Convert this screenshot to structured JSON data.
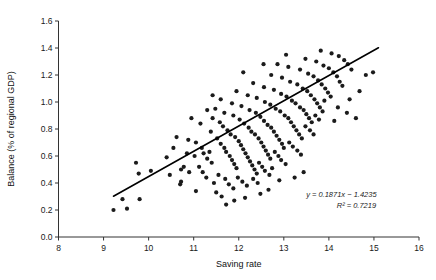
{
  "chart_data": {
    "type": "scatter",
    "title": "",
    "xlabel": "Saving rate",
    "ylabel": "Balance (% of regional GDP)",
    "xlim": [
      8,
      16
    ],
    "ylim": [
      0.0,
      1.6
    ],
    "xticks": [
      8,
      9,
      10,
      11,
      12,
      13,
      14,
      15,
      16
    ],
    "xtick_labels": [
      "8",
      "9",
      "10",
      "11",
      "12",
      "13",
      "14",
      "15",
      "16"
    ],
    "yticks": [
      0.0,
      0.2,
      0.4,
      0.6,
      0.8,
      1.0,
      1.2,
      1.4,
      1.6
    ],
    "ytick_labels": [
      "0.0",
      "0.2",
      "0.4",
      "0.6",
      "0.8",
      "1.0",
      "1.2",
      "1.4",
      "1.6"
    ],
    "grid": false,
    "legend": null,
    "marker_color": "#1b1b1b",
    "marker_size": 2.1,
    "trendline": {
      "slope": 0.1871,
      "intercept": -1.4235,
      "r_squared": 0.7219,
      "x_start": 9.22,
      "x_end": 15.1,
      "y_start": 0.302,
      "y_end": 1.402,
      "color": "#000000"
    },
    "annotations": [
      {
        "text": "y = 0.1871x − 1.4235",
        "x": 13.95,
        "y": 0.3
      },
      {
        "text": "R² = 0.7219",
        "x": 14.05,
        "y": 0.215
      }
    ],
    "equation_label": "y = 0.1871x − 1.4235",
    "r2_label": "R² = 0.7219",
    "points": [
      [
        9.22,
        0.2
      ],
      [
        9.52,
        0.21
      ],
      [
        9.42,
        0.28
      ],
      [
        9.8,
        0.28
      ],
      [
        9.72,
        0.55
      ],
      [
        9.78,
        0.47
      ],
      [
        10.05,
        0.49
      ],
      [
        10.4,
        0.59
      ],
      [
        10.47,
        0.46
      ],
      [
        10.72,
        0.5
      ],
      [
        10.78,
        0.52
      ],
      [
        10.7,
        0.39
      ],
      [
        10.72,
        0.41
      ],
      [
        10.9,
        0.48
      ],
      [
        11.02,
        0.6
      ],
      [
        10.62,
        0.74
      ],
      [
        10.88,
        0.72
      ],
      [
        11.05,
        0.7
      ],
      [
        11.18,
        0.66
      ],
      [
        11.22,
        0.62
      ],
      [
        11.3,
        0.58
      ],
      [
        11.35,
        0.63
      ],
      [
        11.4,
        0.55
      ],
      [
        11.12,
        0.52
      ],
      [
        11.2,
        0.48
      ],
      [
        11.28,
        0.44
      ],
      [
        11.45,
        0.4
      ],
      [
        11.05,
        0.34
      ],
      [
        11.5,
        0.33
      ],
      [
        11.62,
        0.3
      ],
      [
        11.38,
        0.78
      ],
      [
        11.52,
        0.73
      ],
      [
        11.6,
        0.69
      ],
      [
        11.68,
        0.66
      ],
      [
        11.72,
        0.63
      ],
      [
        11.8,
        0.6
      ],
      [
        11.85,
        0.57
      ],
      [
        11.9,
        0.54
      ],
      [
        11.95,
        0.51
      ],
      [
        11.55,
        0.46
      ],
      [
        11.7,
        0.43
      ],
      [
        11.78,
        0.39
      ],
      [
        11.88,
        0.36
      ],
      [
        11.42,
        0.88
      ],
      [
        11.58,
        0.85
      ],
      [
        11.65,
        0.82
      ],
      [
        11.75,
        0.79
      ],
      [
        11.82,
        0.76
      ],
      [
        11.92,
        0.74
      ],
      [
        12.0,
        0.71
      ],
      [
        12.05,
        0.68
      ],
      [
        12.1,
        0.65
      ],
      [
        12.15,
        0.62
      ],
      [
        12.2,
        0.59
      ],
      [
        12.25,
        0.56
      ],
      [
        12.3,
        0.53
      ],
      [
        12.35,
        0.5
      ],
      [
        12.4,
        0.47
      ],
      [
        11.98,
        0.44
      ],
      [
        12.08,
        0.41
      ],
      [
        12.18,
        0.38
      ],
      [
        11.48,
        0.95
      ],
      [
        11.68,
        0.92
      ],
      [
        11.88,
        0.9
      ],
      [
        12.02,
        0.87
      ],
      [
        12.12,
        0.84
      ],
      [
        12.22,
        0.81
      ],
      [
        12.28,
        0.78
      ],
      [
        12.36,
        0.76
      ],
      [
        12.44,
        0.73
      ],
      [
        12.5,
        0.7
      ],
      [
        12.55,
        0.67
      ],
      [
        12.6,
        0.64
      ],
      [
        12.65,
        0.61
      ],
      [
        12.7,
        0.58
      ],
      [
        12.45,
        0.55
      ],
      [
        12.52,
        0.52
      ],
      [
        12.58,
        0.49
      ],
      [
        12.68,
        0.46
      ],
      [
        12.32,
        0.43
      ],
      [
        12.42,
        0.4
      ],
      [
        11.6,
        1.02
      ],
      [
        11.85,
        0.99
      ],
      [
        12.06,
        0.97
      ],
      [
        12.24,
        0.94
      ],
      [
        12.38,
        0.92
      ],
      [
        12.48,
        0.89
      ],
      [
        12.56,
        0.86
      ],
      [
        12.64,
        0.83
      ],
      [
        12.72,
        0.81
      ],
      [
        12.78,
        0.78
      ],
      [
        12.84,
        0.75
      ],
      [
        12.9,
        0.72
      ],
      [
        12.96,
        0.69
      ],
      [
        13.0,
        0.66
      ],
      [
        12.8,
        0.63
      ],
      [
        12.88,
        0.6
      ],
      [
        12.94,
        0.57
      ],
      [
        13.04,
        0.54
      ],
      [
        12.74,
        0.51
      ],
      [
        11.95,
        1.08
      ],
      [
        12.2,
        1.05
      ],
      [
        12.4,
        1.03
      ],
      [
        12.58,
        1.0
      ],
      [
        12.7,
        0.98
      ],
      [
        12.82,
        0.95
      ],
      [
        12.92,
        0.93
      ],
      [
        13.02,
        0.9
      ],
      [
        13.1,
        0.88
      ],
      [
        13.16,
        0.85
      ],
      [
        13.22,
        0.82
      ],
      [
        13.28,
        0.79
      ],
      [
        13.34,
        0.76
      ],
      [
        13.4,
        0.73
      ],
      [
        13.12,
        0.7
      ],
      [
        13.2,
        0.67
      ],
      [
        13.3,
        0.64
      ],
      [
        13.38,
        0.61
      ],
      [
        12.32,
        1.14
      ],
      [
        12.56,
        1.11
      ],
      [
        12.78,
        1.09
      ],
      [
        12.94,
        1.06
      ],
      [
        13.06,
        1.04
      ],
      [
        13.18,
        1.01
      ],
      [
        13.26,
        0.99
      ],
      [
        13.36,
        0.96
      ],
      [
        13.44,
        0.94
      ],
      [
        13.5,
        0.91
      ],
      [
        13.56,
        0.88
      ],
      [
        13.62,
        0.85
      ],
      [
        13.48,
        0.82
      ],
      [
        13.58,
        0.79
      ],
      [
        13.66,
        0.76
      ],
      [
        12.72,
        1.2
      ],
      [
        12.96,
        1.18
      ],
      [
        13.14,
        1.15
      ],
      [
        13.3,
        1.13
      ],
      [
        13.42,
        1.1
      ],
      [
        13.52,
        1.08
      ],
      [
        13.6,
        1.05
      ],
      [
        13.68,
        1.02
      ],
      [
        13.74,
        0.99
      ],
      [
        13.8,
        0.96
      ],
      [
        13.86,
        0.93
      ],
      [
        13.7,
        0.9
      ],
      [
        13.78,
        0.87
      ],
      [
        13.1,
        1.26
      ],
      [
        13.36,
        1.24
      ],
      [
        13.54,
        1.21
      ],
      [
        13.66,
        1.19
      ],
      [
        13.76,
        1.16
      ],
      [
        13.84,
        1.13
      ],
      [
        13.92,
        1.1
      ],
      [
        13.98,
        1.07
      ],
      [
        14.04,
        1.04
      ],
      [
        13.9,
        1.01
      ],
      [
        13.48,
        1.32
      ],
      [
        13.72,
        1.3
      ],
      [
        13.88,
        1.27
      ],
      [
        14.0,
        1.25
      ],
      [
        14.1,
        1.22
      ],
      [
        14.18,
        1.19
      ],
      [
        14.24,
        1.15
      ],
      [
        14.3,
        1.12
      ],
      [
        13.82,
        1.38
      ],
      [
        14.06,
        1.36
      ],
      [
        14.22,
        1.34
      ],
      [
        14.34,
        1.31
      ],
      [
        14.42,
        1.28
      ],
      [
        14.5,
        1.24
      ],
      [
        12.55,
        1.28
      ],
      [
        12.86,
        1.28
      ],
      [
        14.68,
        1.08
      ],
      [
        14.82,
        1.2
      ],
      [
        14.98,
        1.22
      ],
      [
        14.2,
        0.96
      ],
      [
        14.4,
        0.92
      ],
      [
        14.6,
        0.88
      ],
      [
        13.05,
        1.35
      ],
      [
        12.1,
        1.22
      ],
      [
        10.95,
        0.88
      ],
      [
        11.15,
        0.84
      ],
      [
        11.3,
        0.94
      ],
      [
        11.42,
        1.05
      ],
      [
        10.55,
        0.66
      ],
      [
        10.85,
        0.62
      ],
      [
        12.48,
        0.32
      ],
      [
        12.66,
        0.35
      ],
      [
        12.14,
        0.29
      ],
      [
        13.24,
        0.44
      ],
      [
        13.44,
        0.48
      ],
      [
        12.9,
        0.42
      ],
      [
        11.9,
        0.27
      ],
      [
        11.72,
        0.24
      ],
      [
        14.12,
        0.86
      ],
      [
        14.46,
        1.02
      ]
    ]
  },
  "axes": {
    "x_axis_name": "x-axis",
    "y_axis_name": "y-axis"
  }
}
